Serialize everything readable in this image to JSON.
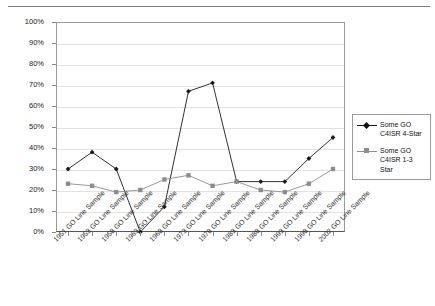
{
  "chart_data": {
    "type": "line",
    "title": "",
    "xlabel": "",
    "ylabel": "",
    "ylim": [
      0,
      100
    ],
    "y_ticks": [
      "0%",
      "10%",
      "20%",
      "30%",
      "40%",
      "50%",
      "60%",
      "70%",
      "80%",
      "90%",
      "100%"
    ],
    "grid": true,
    "legend_position": "right",
    "categories": [
      "1951 GO Line Sample",
      "1953 GO Line Sample",
      "1958 GO Line Sample",
      "1963 GO Line Sample",
      "1968 GO Line Sample",
      "1973 GO Line Sample",
      "1978 GO Line Sample",
      "1983 GO Line Sample",
      "1988 GO Line Sample",
      "1993 GO Line Sample",
      "1998 GO Line Sample",
      "2002 GO Line Sample"
    ],
    "series": [
      {
        "name": "Some GO C4ISR 4-Star",
        "color": "#1a1a1a",
        "marker": "diamond",
        "values": [
          30,
          38,
          30,
          0,
          12,
          67,
          71,
          24,
          24,
          24,
          35,
          45
        ]
      },
      {
        "name": "Some GO C4ISR 1-3 Star",
        "color": "#8d8d8d",
        "marker": "square",
        "values": [
          23,
          22,
          19,
          20,
          25,
          27,
          22,
          24,
          20,
          19,
          23,
          30
        ]
      }
    ]
  },
  "legend": {
    "entries": [
      {
        "label_line1": "Some GO",
        "label_line2": "C4ISR 4-Star"
      },
      {
        "label_line1": "Some GO",
        "label_line2": "C4ISR 1-3 Star"
      }
    ]
  }
}
